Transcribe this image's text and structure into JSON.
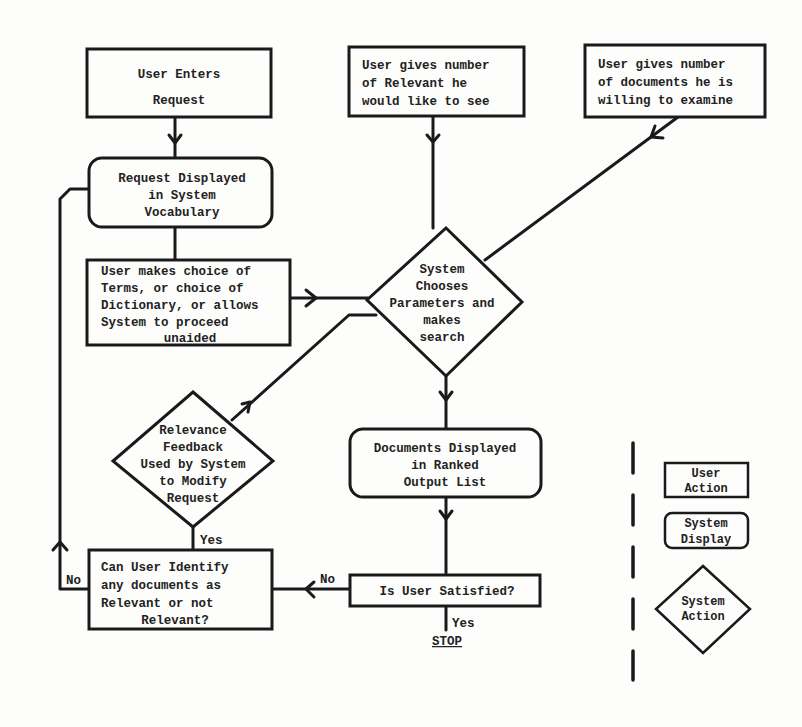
{
  "diagram": {
    "nodes": {
      "user_enters_request": {
        "type": "user-action",
        "lines": [
          "User Enters",
          "Request"
        ]
      },
      "request_displayed": {
        "type": "system-display",
        "lines": [
          "Request Displayed",
          "in System",
          "Vocabulary"
        ]
      },
      "user_makes_choice": {
        "type": "user-action",
        "lines": [
          "User makes choice of",
          "Terms, or choice of",
          "Dictionary, or allows",
          "System to proceed",
          "unaided"
        ]
      },
      "user_gives_relevant": {
        "type": "user-action",
        "lines": [
          "User gives number",
          "of Relevant he",
          "would like to see"
        ]
      },
      "user_gives_documents": {
        "type": "user-action",
        "lines": [
          "User gives number",
          "of documents he is",
          "willing to examine"
        ]
      },
      "system_chooses": {
        "type": "system-action",
        "lines": [
          "System",
          "Chooses",
          "Parameters and",
          "makes",
          "search"
        ]
      },
      "relevance_feedback": {
        "type": "system-action",
        "lines": [
          "Relevance",
          "Feedback",
          "Used by System",
          "to Modify",
          "Request"
        ]
      },
      "documents_displayed": {
        "type": "system-display",
        "lines": [
          "Documents Displayed",
          "in Ranked",
          "Output List"
        ]
      },
      "can_user_identify": {
        "type": "user-action",
        "lines": [
          "Can User Identify",
          "any documents as",
          "Relevant or not",
          "Relevant?"
        ]
      },
      "is_user_satisfied": {
        "type": "user-action",
        "lines": [
          "Is User Satisfied?"
        ]
      }
    },
    "edge_labels": {
      "yes_feedback": "Yes",
      "no_loop": "No",
      "no_satisfied": "No",
      "yes_satisfied": "Yes",
      "stop": "STOP"
    },
    "legend": {
      "user_action": [
        "User",
        "Action"
      ],
      "system_display": [
        "System",
        "Display"
      ],
      "system_action": [
        "System",
        "Action"
      ]
    }
  }
}
